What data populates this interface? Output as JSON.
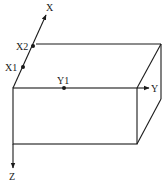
{
  "diagram": {
    "type": "3d-box-coordinate-axes",
    "axes": {
      "x": {
        "label": "X"
      },
      "y": {
        "label": "Y"
      },
      "z": {
        "label": "Z"
      }
    },
    "points": [
      {
        "label": "X1",
        "axis": "x"
      },
      {
        "label": "X2",
        "axis": "x"
      },
      {
        "label": "Y1",
        "axis": "y"
      }
    ],
    "colors": {
      "line": "#1a1a1a",
      "background": "#ffffff"
    }
  }
}
